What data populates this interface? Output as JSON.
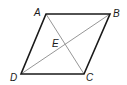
{
  "figure": {
    "type": "parallelogram with diagonals",
    "vertices": {
      "A": {
        "label": "A",
        "x": 46,
        "y": 14
      },
      "B": {
        "label": "B",
        "x": 110,
        "y": 14
      },
      "C": {
        "label": "C",
        "x": 84,
        "y": 74
      },
      "D": {
        "label": "D",
        "x": 21,
        "y": 74
      }
    },
    "intersection": {
      "label": "E",
      "x": 65,
      "y": 44
    },
    "sides": [
      "AB",
      "BC",
      "CD",
      "DA"
    ],
    "diagonals": [
      "AC",
      "BD"
    ],
    "colors": {
      "sides": "#1a1a1a",
      "diagonals": "#8a8a8a",
      "background": "#ffffff"
    }
  }
}
